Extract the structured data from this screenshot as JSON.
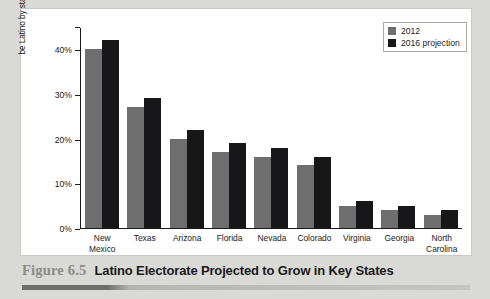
{
  "chart_data": {
    "type": "bar",
    "title": "Latino Electorate Projected to Grow in Key States",
    "figure_number": "Figure 6.5",
    "xlabel": "",
    "ylabel_line1": "Percent of eligible vote that is and will",
    "ylabel_line2": "be Latino by state",
    "categories": [
      "New Mexico",
      "Texas",
      "Arizona",
      "Florida",
      "Nevada",
      "Colorado",
      "Virginia",
      "Georgia",
      "North Carolina"
    ],
    "series": [
      {
        "name": "2012",
        "color": "#6e6e6e",
        "values": [
          40,
          27,
          20,
          17,
          16,
          14,
          5,
          4,
          3
        ]
      },
      {
        "name": "2016 projection",
        "color": "#17171a",
        "values": [
          42,
          29,
          22,
          19,
          18,
          16,
          6,
          5,
          4
        ]
      }
    ],
    "ylim": [
      0,
      45
    ],
    "yticks": [
      0,
      10,
      20,
      30,
      40
    ],
    "ytick_labels": [
      "0%",
      "10%",
      "20%",
      "30%",
      "40%"
    ],
    "grid": false,
    "legend_position": "top-right"
  },
  "categories_wrapped": [
    [
      "New",
      "Mexico"
    ],
    [
      "Texas"
    ],
    [
      "Arizona"
    ],
    [
      "Florida"
    ],
    [
      "Nevada"
    ],
    [
      "Colorado"
    ],
    [
      "Virginia"
    ],
    [
      "Georgia"
    ],
    [
      "North",
      "Carolina"
    ]
  ]
}
